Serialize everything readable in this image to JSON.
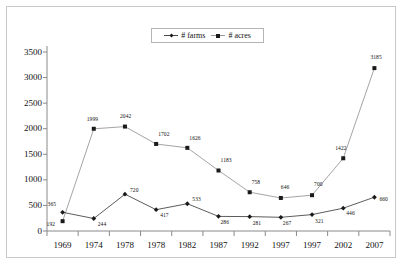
{
  "chart_data": {
    "type": "line",
    "title": "",
    "xlabel": "",
    "ylabel": "",
    "ylim": [
      0,
      3500
    ],
    "yticks": [
      0,
      500,
      1000,
      1500,
      2000,
      2500,
      3000,
      3500
    ],
    "grid": false,
    "legend_position": "top-center",
    "categories": [
      "1969",
      "1974",
      "1978",
      "1978",
      "1982",
      "1987",
      "1992",
      "1997",
      "1997",
      "2002",
      "2007"
    ],
    "series": [
      {
        "name": "# farms",
        "marker": "diamond",
        "color": "#4a4a4a",
        "values": [
          365,
          244,
          720,
          417,
          533,
          286,
          281,
          267,
          321,
          446,
          660
        ]
      },
      {
        "name": "# acres",
        "marker": "square",
        "color": "#9a9a9a",
        "values": [
          192,
          1999,
          2042,
          1702,
          1626,
          1183,
          758,
          646,
          700,
          1422,
          3185
        ]
      }
    ]
  },
  "legend": {
    "items": [
      {
        "label": "# farms"
      },
      {
        "label": "# acres"
      }
    ]
  },
  "colors": {
    "farms_line": "#4a4a4a",
    "acres_line": "#9a9a9a",
    "marker": "#1a1a1a",
    "axis": "#8a8a8a",
    "frame": "#c9c9c9"
  }
}
